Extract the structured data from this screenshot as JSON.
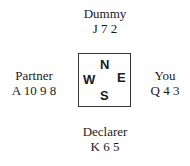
{
  "hands": {
    "north": {
      "name": "Dummy",
      "cards": "J 7 2"
    },
    "west": {
      "name": "Partner",
      "cards": "A 10 9 8"
    },
    "east": {
      "name": "You",
      "cards": "Q 4 3"
    },
    "south": {
      "name": "Declarer",
      "cards": "K 6 5"
    }
  },
  "compass": {
    "n": "N",
    "e": "E",
    "s": "S",
    "w": "W"
  }
}
